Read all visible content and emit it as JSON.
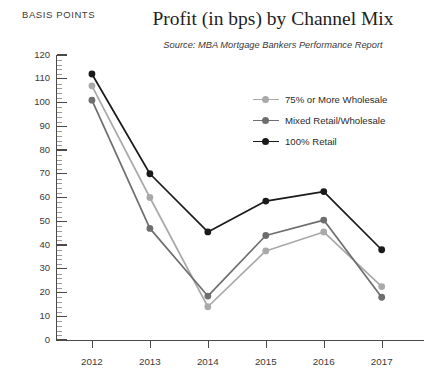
{
  "header": {
    "title": "Profit (in bps) by Channel Mix",
    "source": "Source: MBA Mortgage Bankers Performance Report",
    "axis_unit_label": "BASIS POINTS"
  },
  "colors": {
    "series_light_gray": "#a9a9a9",
    "series_mid_gray": "#6e6e6e",
    "series_black": "#1a1a1a",
    "axis": "#4a4a4a",
    "minor_tick": "#9a9a9a",
    "text": "#2b2b2b",
    "background": "#ffffff"
  },
  "legend": {
    "position": "inside-top-right",
    "entries": [
      {
        "label": "75% or More Wholesale",
        "color": "#a9a9a9"
      },
      {
        "label": "Mixed Retail/Wholesale",
        "color": "#6e6e6e"
      },
      {
        "label": "100% Retail",
        "color": "#1a1a1a"
      }
    ]
  },
  "chart_data": {
    "type": "line",
    "title": "Profit (in bps) by Channel Mix",
    "subtitle": "Source: MBA Mortgage Bankers Performance Report",
    "xlabel": "",
    "ylabel": "BASIS POINTS",
    "ylim": [
      0,
      120
    ],
    "ytick_step": 10,
    "yticks": [
      0,
      10,
      20,
      30,
      40,
      50,
      60,
      70,
      80,
      90,
      100,
      110,
      120
    ],
    "minor_ticks": true,
    "grid": false,
    "categories": [
      "2012",
      "2013",
      "2014",
      "2015",
      "2016",
      "2017"
    ],
    "series": [
      {
        "name": "75% or More Wholesale",
        "color": "#a9a9a9",
        "values": [
          107,
          60,
          14,
          37.5,
          45.5,
          22.5
        ]
      },
      {
        "name": "Mixed Retail/Wholesale",
        "color": "#6e6e6e",
        "values": [
          101,
          47,
          18.5,
          44,
          50.5,
          18
        ]
      },
      {
        "name": "100% Retail",
        "color": "#1a1a1a",
        "values": [
          112,
          70,
          45.5,
          58.5,
          62.5,
          38
        ]
      }
    ]
  }
}
